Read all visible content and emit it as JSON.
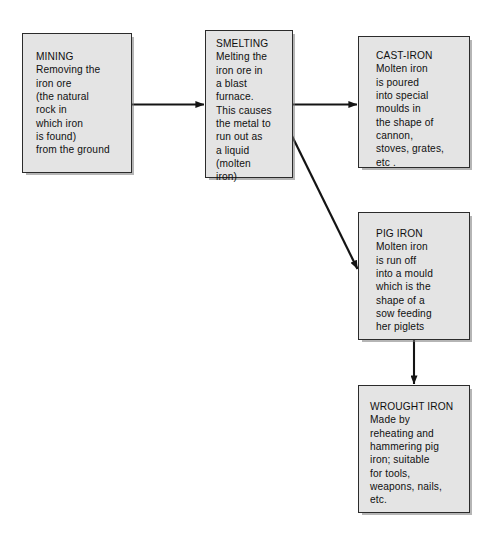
{
  "diagram": {
    "background_color": "#ffffff",
    "node_fill_color": "#e4e4e4",
    "node_border_color": "#2b2b2b",
    "arrow_color": "#141414",
    "nodes": [
      {
        "id": "mining",
        "heading": "MINING",
        "body": "Removing the\niron ore\n(the natural\nrock in\nwhich iron\nis found)\nfrom the ground",
        "full_text": "MINING\nRemoving the\niron ore\n(the natural\nrock in\nwhich iron\nis found)\nfrom the ground",
        "x": 22,
        "y": 33,
        "w": 110,
        "h": 140
      },
      {
        "id": "smelting",
        "heading": "SMELTING",
        "body": "Melting the\niron ore in\na blast\nfurnace.\nThis causes\nthe metal to\nrun out as\na liquid\n(molten\niron)",
        "full_text": "SMELTING\nMelting the\niron ore in\na blast\nfurnace.\nThis causes\nthe metal to\nrun out as\na liquid\n(molten\niron)",
        "x": 205,
        "y": 30,
        "w": 88,
        "h": 148
      },
      {
        "id": "cast-iron",
        "heading": "CAST-IRON",
        "body": "Molten iron\nis poured\ninto special\nmoulds in\nthe shape of\ncannon,\nstoves, grates,\netc .",
        "full_text": "CAST-IRON\nMolten iron\nis poured\ninto special\nmoulds in\nthe shape of\ncannon,\nstoves, grates,\netc .",
        "x": 358,
        "y": 36,
        "w": 112,
        "h": 132
      },
      {
        "id": "pig-iron",
        "heading": "PIG IRON",
        "body": "Molten iron\nis run off\ninto a mould\nwhich is the\nshape of a\nsow feeding\nher piglets",
        "full_text": "PIG IRON\nMolten iron\nis run off\ninto a mould\nwhich is the\nshape of a\nsow feeding\nher piglets",
        "x": 358,
        "y": 212,
        "w": 112,
        "h": 128
      },
      {
        "id": "wrought-iron",
        "heading": "WROUGHT IRON",
        "body": "Made by\nreheating and\nhammering pig\niron; suitable\nfor tools,\nweapons, nails,\netc.",
        "full_text": "WROUGHT IRON\nMade by\nreheating and\nhammering pig\niron; suitable\nfor tools,\nweapons, nails,\netc.",
        "x": 358,
        "y": 385,
        "w": 112,
        "h": 128
      }
    ],
    "edges": [
      {
        "id": "mining-to-smelting",
        "from": "mining",
        "to": "smelting",
        "kind": "horizontal",
        "label": ""
      },
      {
        "id": "smelting-to-cast-iron",
        "from": "smelting",
        "to": "cast-iron",
        "kind": "horizontal",
        "label": ""
      },
      {
        "id": "smelting-to-pig-iron",
        "from": "smelting",
        "to": "pig-iron",
        "kind": "diagonal",
        "label": ""
      },
      {
        "id": "pig-iron-to-wrought-iron",
        "from": "pig-iron",
        "to": "wrought-iron",
        "kind": "vertical",
        "label": ""
      }
    ]
  }
}
